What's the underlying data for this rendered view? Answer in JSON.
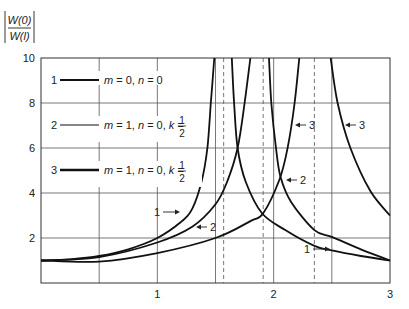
{
  "chart_data": {
    "type": "line",
    "title": "",
    "ylabel": "|W(0) / W(l)|",
    "ylabel_parts": {
      "numerator": "W(0)",
      "denominator": "W(l)"
    },
    "xlabel": "",
    "xlim": [
      0,
      3
    ],
    "ylim": [
      0,
      10
    ],
    "x_ticks": [
      {
        "value": 1,
        "label": "1"
      },
      {
        "value": 2,
        "label": "2"
      },
      {
        "value": 3,
        "label": "3"
      }
    ],
    "y_ticks": [
      {
        "value": 2,
        "label": "2"
      },
      {
        "value": 4,
        "label": "4"
      },
      {
        "value": 6,
        "label": "6"
      },
      {
        "value": 8,
        "label": "8"
      },
      {
        "value": 10,
        "label": "10"
      }
    ],
    "grid": true,
    "vertical_grid": [
      0.5,
      1,
      1.5,
      2,
      2.5
    ],
    "horizontal_grid": [
      2,
      4,
      6,
      8
    ],
    "dashed_asymptotes": [
      1.57,
      1.91,
      2.35
    ],
    "legend_position": "upper-left",
    "legend": [
      {
        "id": "1",
        "label_parts": [
          "m",
          " = 0, ",
          "n",
          " = 0"
        ],
        "has_fraction": false,
        "stroke_width": 1.8
      },
      {
        "id": "2",
        "label_parts": [
          "m",
          " = 1, ",
          "n",
          " = 0, ",
          "k",
          " = "
        ],
        "has_fraction": true,
        "fraction": {
          "num": "1",
          "den": "2"
        },
        "stroke_width": 1.2
      },
      {
        "id": "3",
        "label_parts": [
          "m",
          " = 1, ",
          "n",
          " = 0, ",
          "k",
          " = "
        ],
        "has_fraction": true,
        "fraction": {
          "num": "1",
          "den": "2"
        },
        "stroke_width": 2.4
      }
    ],
    "series": [
      {
        "name": "1",
        "legend": "m = 0, n = 0",
        "branch": "rising",
        "points": [
          [
            0,
            1
          ],
          [
            0.25,
            1.05
          ],
          [
            0.5,
            1.2
          ],
          [
            0.75,
            1.5
          ],
          [
            1.0,
            2.0
          ],
          [
            1.2,
            2.7
          ],
          [
            1.3,
            3.3
          ],
          [
            1.38,
            4.5
          ],
          [
            1.43,
            6
          ],
          [
            1.46,
            8
          ],
          [
            1.49,
            10
          ]
        ]
      },
      {
        "name": "1",
        "legend": "m = 0, n = 0",
        "branch": "descending",
        "points": [
          [
            1.64,
            10
          ],
          [
            1.66,
            8
          ],
          [
            1.69,
            6
          ],
          [
            1.76,
            4.5
          ],
          [
            1.9,
            3.1
          ],
          [
            2.1,
            2.35
          ],
          [
            2.35,
            1.65
          ],
          [
            2.5,
            1.45
          ],
          [
            2.75,
            1.2
          ],
          [
            3.0,
            1.0
          ]
        ]
      },
      {
        "name": "2",
        "legend": "m = 1, n = 0, k = 1/2",
        "branch": "rising",
        "points": [
          [
            0,
            1
          ],
          [
            0.5,
            1.15
          ],
          [
            1.0,
            1.8
          ],
          [
            1.3,
            2.5
          ],
          [
            1.5,
            3.5
          ],
          [
            1.6,
            4.5
          ],
          [
            1.69,
            6
          ],
          [
            1.75,
            8
          ],
          [
            1.8,
            10
          ]
        ]
      },
      {
        "name": "2",
        "legend": "m = 1, n = 0, k = 1/2",
        "branch": "descending",
        "points": [
          [
            1.96,
            10
          ],
          [
            1.98,
            8
          ],
          [
            2.02,
            6
          ],
          [
            2.06,
            4.7
          ],
          [
            2.15,
            3.6
          ],
          [
            2.35,
            2.35
          ],
          [
            2.5,
            2.05
          ],
          [
            2.75,
            1.5
          ],
          [
            3.0,
            1.0
          ]
        ]
      },
      {
        "name": "3",
        "legend": "m = 1, n = 0, k = 1/2",
        "branch": "rising",
        "points": [
          [
            0,
            1
          ],
          [
            0.5,
            0.95
          ],
          [
            1.0,
            1.33
          ],
          [
            1.5,
            2.0
          ],
          [
            1.8,
            2.75
          ],
          [
            1.91,
            3.1
          ],
          [
            2.05,
            4.6
          ],
          [
            2.12,
            6
          ],
          [
            2.18,
            8
          ],
          [
            2.22,
            10
          ]
        ]
      },
      {
        "name": "3",
        "legend": "m = 1, n = 0, k = 1/2",
        "branch": "descending",
        "points": [
          [
            2.49,
            10
          ],
          [
            2.55,
            8
          ],
          [
            2.66,
            6
          ],
          [
            2.83,
            4.1
          ],
          [
            3.0,
            3.0
          ]
        ]
      }
    ],
    "annotations": [
      {
        "text": "1",
        "arrow": "right",
        "x_px": 170,
        "y_px": 212
      },
      {
        "text": "2",
        "arrow": "left",
        "x_px": 196,
        "y_px": 227
      },
      {
        "text": "3",
        "arrow": "left",
        "x_px": 295,
        "y_px": 125
      },
      {
        "text": "3",
        "arrow": "left",
        "x_px": 345,
        "y_px": 125
      },
      {
        "text": "2",
        "arrow": "left",
        "x_px": 286,
        "y_px": 180
      },
      {
        "text": "1",
        "arrow": "right",
        "x_px": 320,
        "y_px": 249
      }
    ]
  }
}
